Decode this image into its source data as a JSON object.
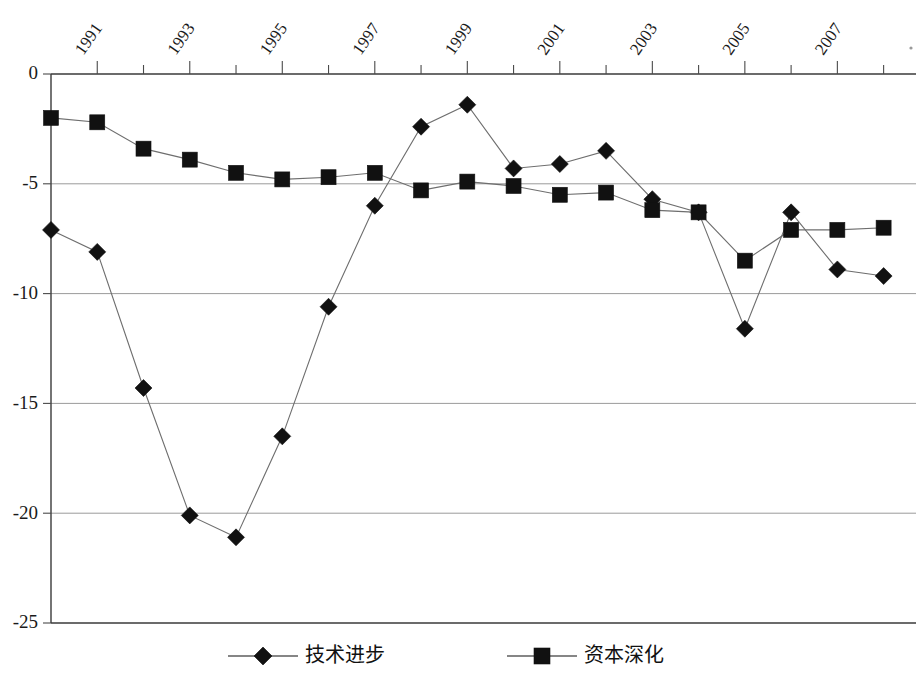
{
  "chart_data": {
    "type": "line",
    "title": "",
    "subtitle": "",
    "xlabel": "",
    "ylabel": "",
    "x": [
      1990,
      1991,
      1992,
      1993,
      1994,
      1995,
      1996,
      1997,
      1998,
      1999,
      2000,
      2001,
      2002,
      2003,
      2004,
      2005,
      2006,
      2007,
      2008
    ],
    "categories": [
      "1990",
      "1991",
      "1992",
      "1993",
      "1994",
      "1995",
      "1996",
      "1997",
      "1998",
      "1999",
      "2000",
      "2001",
      "2002",
      "2003",
      "2004",
      "2005",
      "2006",
      "2007",
      "2008"
    ],
    "xtick_labels": [
      "1991",
      "1993",
      "1995",
      "1997",
      "1999",
      "2001",
      "2003",
      "2005",
      "2007"
    ],
    "xtick_values": [
      1991,
      1993,
      1995,
      1997,
      1999,
      2001,
      2003,
      2005,
      2007
    ],
    "xlim": [
      1990,
      2008.7
    ],
    "ylim": [
      -25,
      0
    ],
    "ytick_labels": [
      "0",
      "-5",
      "-10",
      "-15",
      "-20",
      "-25"
    ],
    "ytick_values": [
      0,
      -5,
      -10,
      -15,
      -20,
      -25
    ],
    "grid": "horizontal",
    "legend_position": "bottom",
    "series": [
      {
        "name": "技术进步",
        "marker": "diamond",
        "color": "#111111",
        "values": [
          -7.1,
          -8.1,
          -14.3,
          -20.1,
          -21.1,
          -16.5,
          -10.6,
          -6.0,
          -2.4,
          -1.4,
          -4.3,
          -4.1,
          -3.5,
          -5.7,
          -6.3,
          -11.6,
          -6.3,
          -8.9,
          -9.2
        ]
      },
      {
        "name": "资本深化",
        "marker": "square",
        "color": "#111111",
        "values": [
          -2.0,
          -2.2,
          -3.4,
          -3.9,
          -4.5,
          -4.8,
          -4.7,
          -4.5,
          -5.3,
          -4.9,
          -5.1,
          -5.5,
          -5.4,
          -6.2,
          -6.3,
          -8.5,
          -7.1,
          -7.1,
          -7.0
        ]
      }
    ]
  },
  "legend": {
    "items": [
      {
        "label": "技术进步",
        "marker": "diamond-marker"
      },
      {
        "label": "资本深化",
        "marker": "square-marker"
      }
    ]
  }
}
